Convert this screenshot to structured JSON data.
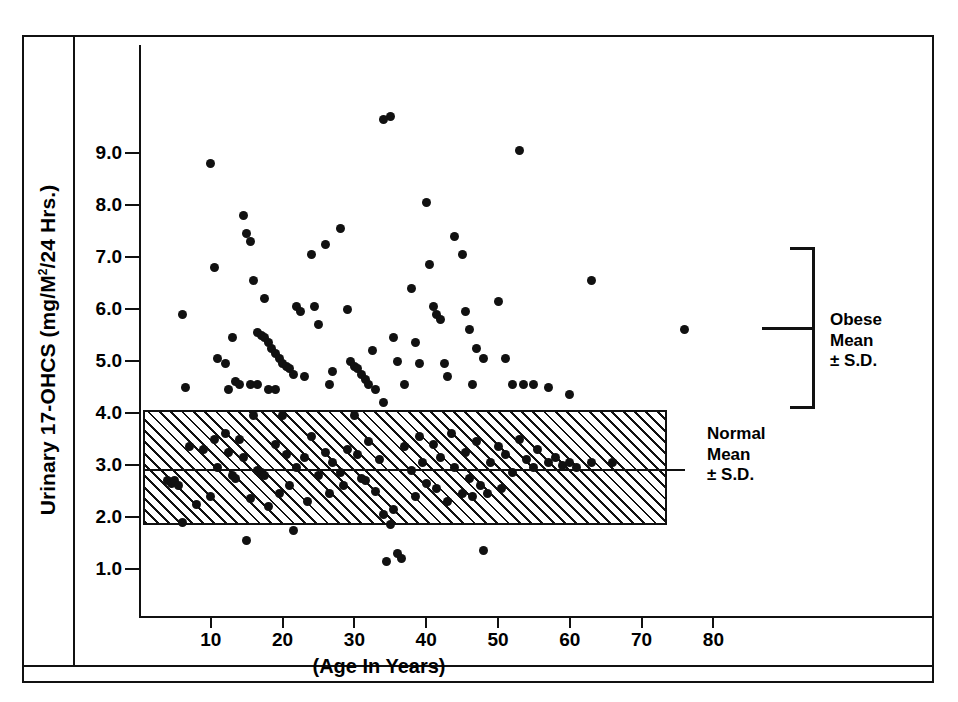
{
  "figure": {
    "y_axis_title": "Urinary 17-OHCS (mg/M",
    "y_axis_title_sup": "2",
    "y_axis_title_tail": "/24 Hrs.)",
    "x_axis_title": "(Age In Years)"
  },
  "annotations": {
    "obese": {
      "line1": "Obese",
      "line2": "Mean",
      "line3": "± S.D."
    },
    "normal": {
      "line1": "Normal",
      "line2": "Mean",
      "line3": "± S.D."
    }
  },
  "chart_data": {
    "type": "scatter",
    "title": "",
    "xlabel": "(Age In Years)",
    "ylabel": "Urinary 17-OHCS (mg/M2/24 Hrs.)",
    "xlim": [
      0,
      90
    ],
    "ylim": [
      0.4,
      10.2
    ],
    "xticks": [
      10,
      20,
      30,
      40,
      50,
      60,
      70,
      80
    ],
    "xticklabels": [
      "10",
      "20",
      "30",
      "40",
      "50",
      "60",
      "70",
      "80"
    ],
    "yticks": [
      1.0,
      2.0,
      3.0,
      4.0,
      5.0,
      6.0,
      7.0,
      8.0,
      9.0
    ],
    "yticklabels": [
      "1.0",
      "2.0",
      "3.0",
      "4.0",
      "5.0",
      "6.0",
      "7.0",
      "8.0",
      "9.0"
    ],
    "grid": false,
    "legend": false,
    "marker": "filled-circle",
    "marker_color": "#111111",
    "bands": [
      {
        "name": "Normal Mean ± S.D.",
        "y_low": 1.85,
        "y_high": 4.05,
        "mean": 2.9,
        "x_start": 0.5,
        "x_end": 73.5,
        "fill": "diagonal-hatch",
        "edge_color": "#111111"
      }
    ],
    "reference_brackets": [
      {
        "name": "Obese Mean ± S.D.",
        "y_high": 7.15,
        "y_mean": 5.6,
        "y_low": 4.05
      },
      {
        "name": "Normal Mean ± S.D.",
        "y_high": 4.05,
        "y_mean": 2.9,
        "y_low": 1.85
      }
    ],
    "series": [
      {
        "name": "Subjects",
        "points": [
          [
            6,
            5.9
          ],
          [
            6.5,
            4.5
          ],
          [
            10,
            8.8
          ],
          [
            10.5,
            6.8
          ],
          [
            11,
            5.05
          ],
          [
            12,
            4.95
          ],
          [
            13,
            5.45
          ],
          [
            14.5,
            7.8
          ],
          [
            15,
            7.45
          ],
          [
            15.5,
            7.3
          ],
          [
            16,
            6.55
          ],
          [
            16.5,
            5.55
          ],
          [
            17,
            5.5
          ],
          [
            17.5,
            5.45
          ],
          [
            18,
            5.35
          ],
          [
            18.5,
            5.25
          ],
          [
            19,
            5.15
          ],
          [
            19.5,
            5.05
          ],
          [
            20,
            4.95
          ],
          [
            20.5,
            4.9
          ],
          [
            13.5,
            4.6
          ],
          [
            14,
            4.55
          ],
          [
            15.5,
            4.55
          ],
          [
            12.5,
            4.45
          ],
          [
            16.5,
            4.55
          ],
          [
            21,
            4.85
          ],
          [
            21.5,
            4.75
          ],
          [
            17.5,
            6.2
          ],
          [
            18,
            4.45
          ],
          [
            19,
            4.45
          ],
          [
            22,
            6.05
          ],
          [
            22.5,
            5.95
          ],
          [
            23,
            4.7
          ],
          [
            24,
            7.05
          ],
          [
            24.5,
            6.05
          ],
          [
            25,
            5.7
          ],
          [
            26,
            7.25
          ],
          [
            26.5,
            4.55
          ],
          [
            27,
            4.8
          ],
          [
            28,
            7.55
          ],
          [
            29,
            6.0
          ],
          [
            29.5,
            5.0
          ],
          [
            30,
            4.9
          ],
          [
            30.5,
            4.85
          ],
          [
            31,
            4.75
          ],
          [
            31.5,
            4.65
          ],
          [
            32,
            4.55
          ],
          [
            32.5,
            5.2
          ],
          [
            33,
            4.45
          ],
          [
            34,
            4.2
          ],
          [
            35,
            9.7
          ],
          [
            34,
            9.65
          ],
          [
            35.5,
            5.45
          ],
          [
            36,
            5.0
          ],
          [
            37,
            4.55
          ],
          [
            38,
            6.4
          ],
          [
            38.5,
            5.35
          ],
          [
            39,
            4.95
          ],
          [
            40,
            8.05
          ],
          [
            40.5,
            6.85
          ],
          [
            41,
            6.05
          ],
          [
            41.5,
            5.9
          ],
          [
            42,
            5.8
          ],
          [
            42.5,
            4.95
          ],
          [
            43,
            4.7
          ],
          [
            44,
            7.4
          ],
          [
            45,
            7.05
          ],
          [
            45.5,
            5.95
          ],
          [
            46,
            5.6
          ],
          [
            46.5,
            4.55
          ],
          [
            47,
            5.25
          ],
          [
            48,
            5.05
          ],
          [
            50,
            6.15
          ],
          [
            51,
            5.05
          ],
          [
            52,
            4.55
          ],
          [
            53,
            9.05
          ],
          [
            53.5,
            4.55
          ],
          [
            55,
            4.55
          ],
          [
            57,
            4.5
          ],
          [
            60,
            4.35
          ],
          [
            63,
            6.55
          ],
          [
            76,
            5.6
          ],
          [
            4,
            2.7
          ],
          [
            4.5,
            2.65
          ],
          [
            5,
            2.7
          ],
          [
            5.5,
            2.6
          ],
          [
            6,
            1.9
          ],
          [
            7,
            3.35
          ],
          [
            8,
            2.25
          ],
          [
            9,
            3.3
          ],
          [
            10,
            2.4
          ],
          [
            10.5,
            3.5
          ],
          [
            11,
            2.95
          ],
          [
            12,
            3.6
          ],
          [
            12.5,
            3.25
          ],
          [
            13,
            2.8
          ],
          [
            13.5,
            2.75
          ],
          [
            14,
            3.5
          ],
          [
            14.5,
            3.15
          ],
          [
            15,
            1.55
          ],
          [
            15.5,
            2.35
          ],
          [
            16,
            3.95
          ],
          [
            16.5,
            2.9
          ],
          [
            17,
            2.85
          ],
          [
            17.5,
            2.8
          ],
          [
            18,
            2.2
          ],
          [
            19,
            3.4
          ],
          [
            19.5,
            2.45
          ],
          [
            20,
            3.95
          ],
          [
            20.5,
            3.2
          ],
          [
            21,
            2.6
          ],
          [
            21.5,
            1.75
          ],
          [
            22,
            2.95
          ],
          [
            23,
            3.15
          ],
          [
            23.5,
            2.3
          ],
          [
            24,
            3.55
          ],
          [
            25,
            2.8
          ],
          [
            26,
            3.25
          ],
          [
            26.5,
            2.45
          ],
          [
            27,
            3.05
          ],
          [
            28,
            2.85
          ],
          [
            28.5,
            2.6
          ],
          [
            29,
            3.3
          ],
          [
            30,
            3.95
          ],
          [
            30.5,
            3.2
          ],
          [
            31,
            2.75
          ],
          [
            31.5,
            2.7
          ],
          [
            32,
            3.45
          ],
          [
            33,
            2.5
          ],
          [
            33.5,
            3.1
          ],
          [
            34,
            2.05
          ],
          [
            34.5,
            1.15
          ],
          [
            35,
            1.85
          ],
          [
            36,
            1.3
          ],
          [
            36.5,
            1.2
          ],
          [
            35.5,
            2.15
          ],
          [
            37,
            3.35
          ],
          [
            38,
            2.9
          ],
          [
            38.5,
            2.4
          ],
          [
            39,
            3.55
          ],
          [
            39.5,
            3.05
          ],
          [
            40,
            2.65
          ],
          [
            41,
            3.4
          ],
          [
            41.5,
            2.55
          ],
          [
            42,
            3.15
          ],
          [
            43,
            2.3
          ],
          [
            43.5,
            3.6
          ],
          [
            44,
            2.95
          ],
          [
            45,
            2.45
          ],
          [
            45.5,
            3.25
          ],
          [
            46,
            2.75
          ],
          [
            46.5,
            2.4
          ],
          [
            47,
            3.45
          ],
          [
            47.5,
            2.6
          ],
          [
            48,
            1.35
          ],
          [
            48.5,
            2.45
          ],
          [
            49,
            3.05
          ],
          [
            50,
            3.35
          ],
          [
            50.5,
            2.55
          ],
          [
            51,
            3.2
          ],
          [
            52,
            2.85
          ],
          [
            53,
            3.5
          ],
          [
            54,
            3.1
          ],
          [
            55,
            2.95
          ],
          [
            55.5,
            3.3
          ],
          [
            57,
            3.05
          ],
          [
            58,
            3.15
          ],
          [
            59,
            3.0
          ],
          [
            60,
            3.05
          ],
          [
            61,
            2.95
          ],
          [
            63,
            3.05
          ],
          [
            66,
            3.05
          ]
        ]
      }
    ]
  }
}
